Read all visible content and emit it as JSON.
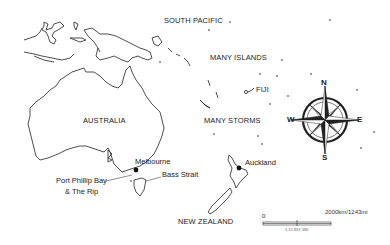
{
  "map": {
    "labels": {
      "south_pacific": "SOUTH PACIFIC",
      "many_islands": "MANY ISLANDS",
      "fiji": "FIJI",
      "australia": "AUSTRALIA",
      "many_storms": "MANY STORMS",
      "melbourne": "Melbourne",
      "bass_strait": "Bass Strait",
      "port_phillip_line1": "Port Phillip Bay",
      "port_phillip_line2": "& The Rip",
      "auckland": "Auckland",
      "new_zealand": "NEW ZEALAND"
    },
    "compass": {
      "icon": "compass-rose-icon",
      "n": "N",
      "s": "S",
      "e": "E",
      "w": "W"
    },
    "scale": {
      "zero": "0",
      "max_label": "2000km/1243mi",
      "ratio": "1:15 833 386"
    },
    "colors": {
      "outline": "#222222",
      "background": "#ffffff",
      "text": "#222222"
    }
  }
}
